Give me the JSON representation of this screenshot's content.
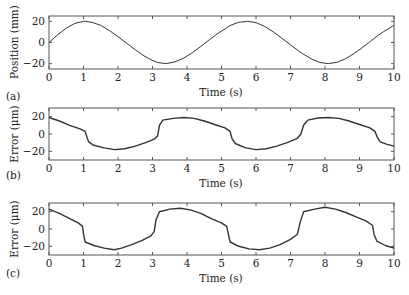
{
  "figure": {
    "width": 409,
    "height": 295,
    "line_color": "#333333",
    "frame_color": "#555555"
  },
  "chart_data": [
    {
      "id": "a",
      "type": "line",
      "panel_label": "(a)",
      "title": "",
      "xlabel": "Time (s)",
      "ylabel": "Position (mm)",
      "xlim": [
        0,
        10
      ],
      "ylim": [
        -25,
        25
      ],
      "xticks": [
        0,
        1,
        2,
        3,
        4,
        5,
        6,
        7,
        8,
        9,
        10
      ],
      "yticks": [
        -20,
        0,
        20
      ],
      "ytick_labels": [
        "−20",
        "0",
        "20"
      ],
      "grid": false,
      "legend": null,
      "frame": {
        "left": 49,
        "right": 394,
        "top": 16,
        "bottom": 69
      },
      "series": [
        {
          "name": "position",
          "x": [
            0,
            0.25,
            0.5,
            0.75,
            1.0,
            1.05,
            1.25,
            1.5,
            1.75,
            2.0,
            2.25,
            2.5,
            2.75,
            3.0,
            3.15,
            3.4,
            3.65,
            3.9,
            4.15,
            4.4,
            4.65,
            4.9,
            5.15,
            5.25,
            5.5,
            5.75,
            6.0,
            6.25,
            6.5,
            6.75,
            7.0,
            7.25,
            7.35,
            7.6,
            7.85,
            8.1,
            8.35,
            8.6,
            8.85,
            9.1,
            9.35,
            9.45,
            9.7,
            9.95,
            10.0
          ],
          "y": [
            0,
            7.3,
            13.5,
            18.0,
            19.9,
            20.0,
            19.1,
            16.1,
            11.3,
            5.5,
            -0.7,
            -6.9,
            -12.5,
            -17.0,
            -19.0,
            -19.9,
            -18.3,
            -14.8,
            -9.7,
            -3.7,
            2.6,
            8.7,
            13.9,
            16.0,
            19.1,
            20.0,
            18.8,
            15.2,
            10.1,
            4.0,
            -2.2,
            -8.3,
            -10.5,
            -15.4,
            -18.9,
            -19.9,
            -18.7,
            -15.3,
            -10.3,
            -4.3,
            2.0,
            4.4,
            10.3,
            15.2,
            16.0
          ]
        }
      ]
    },
    {
      "id": "b",
      "type": "line",
      "panel_label": "(b)",
      "title": "",
      "xlabel": "Time (s)",
      "ylabel": "Error (μm)",
      "xlim": [
        0,
        10
      ],
      "ylim": [
        -30,
        30
      ],
      "xticks": [
        0,
        1,
        2,
        3,
        4,
        5,
        6,
        7,
        8,
        9,
        10
      ],
      "yticks": [
        -20,
        0,
        20
      ],
      "ytick_labels": [
        "−20",
        "0",
        "20"
      ],
      "grid": false,
      "legend": null,
      "frame": {
        "left": 49,
        "right": 394,
        "top": 108,
        "bottom": 160
      },
      "series": [
        {
          "name": "error",
          "x": [
            0,
            0.3,
            0.6,
            0.9,
            1.05,
            1.1,
            1.15,
            1.3,
            1.6,
            1.9,
            2.2,
            2.5,
            2.8,
            3.05,
            3.15,
            3.2,
            3.3,
            3.6,
            3.9,
            4.2,
            4.5,
            4.8,
            5.1,
            5.25,
            5.3,
            5.4,
            5.7,
            6.0,
            6.3,
            6.6,
            6.9,
            7.2,
            7.3,
            7.38,
            7.5,
            7.8,
            8.1,
            8.4,
            8.7,
            9.0,
            9.3,
            9.45,
            9.52,
            9.6,
            9.8,
            10.0
          ],
          "y": [
            19,
            15,
            10,
            6,
            3,
            -4,
            -9,
            -13,
            -16,
            -18,
            -17,
            -14,
            -10,
            -6,
            -2,
            10,
            16,
            18,
            19,
            18,
            15,
            11,
            7,
            3,
            -5,
            -11,
            -16,
            -18,
            -17,
            -14,
            -10,
            -5,
            0,
            10,
            16,
            18.5,
            19,
            18,
            15,
            11,
            7,
            3,
            -4,
            -9,
            -12,
            -14
          ]
        }
      ]
    },
    {
      "id": "c",
      "type": "line",
      "panel_label": "(c)",
      "title": "",
      "xlabel": "Time (s)",
      "ylabel": "Error (μm)",
      "xlim": [
        0,
        10
      ],
      "ylim": [
        -30,
        30
      ],
      "xticks": [
        0,
        1,
        2,
        3,
        4,
        5,
        6,
        7,
        8,
        9,
        10
      ],
      "yticks": [
        -20,
        0,
        20
      ],
      "ytick_labels": [
        "−20",
        "0",
        "20"
      ],
      "grid": false,
      "legend": null,
      "frame": {
        "left": 49,
        "right": 394,
        "top": 203,
        "bottom": 255
      },
      "series": [
        {
          "name": "error",
          "x": [
            0,
            0.3,
            0.6,
            0.85,
            0.97,
            1.0,
            1.05,
            1.3,
            1.6,
            1.9,
            2.1,
            2.4,
            2.7,
            2.95,
            3.05,
            3.1,
            3.2,
            3.5,
            3.8,
            4.1,
            4.4,
            4.7,
            5.0,
            5.15,
            5.2,
            5.25,
            5.5,
            5.8,
            6.1,
            6.4,
            6.7,
            7.0,
            7.2,
            7.28,
            7.38,
            7.7,
            8.0,
            8.3,
            8.6,
            8.9,
            9.2,
            9.38,
            9.42,
            9.5,
            9.75,
            10.0
          ],
          "y": [
            23,
            18,
            12,
            7,
            3,
            -6,
            -15,
            -19,
            -22,
            -24,
            -22,
            -18,
            -13,
            -8,
            -3,
            10,
            20,
            23,
            24,
            22,
            18,
            12,
            7,
            3,
            -6,
            -15,
            -20,
            -23,
            -24,
            -22,
            -18,
            -12,
            -6,
            8,
            20,
            23,
            25,
            23,
            19,
            14,
            9,
            4,
            -6,
            -14,
            -19,
            -22
          ]
        }
      ]
    }
  ]
}
